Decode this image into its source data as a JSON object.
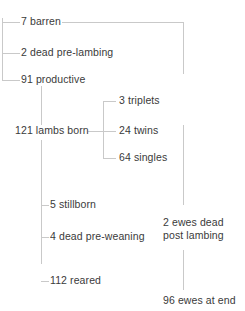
{
  "diagram": {
    "type": "flow-tree",
    "line_color": "#c9c9c9",
    "text_color": "#3a3a3a",
    "background": "#ffffff"
  },
  "nodes": {
    "barren": {
      "label": "7 barren",
      "value": 7,
      "name": "barren"
    },
    "dead_pre_lambing": {
      "label": "2 dead pre-lambing",
      "value": 2,
      "name": "dead pre-lambing"
    },
    "productive": {
      "label": "91 productive",
      "value": 91,
      "name": "productive"
    },
    "lambs_born": {
      "label": "121 lambs born",
      "value": 121,
      "name": "lambs born"
    },
    "triplets": {
      "label": "3 triplets",
      "value": 3,
      "name": "triplets"
    },
    "twins": {
      "label": "24 twins",
      "value": 24,
      "name": "twins"
    },
    "singles": {
      "label": "64 singles",
      "value": 64,
      "name": "singles"
    },
    "stillborn": {
      "label": "5 stillborn",
      "value": 5,
      "name": "stillborn"
    },
    "dead_pre_weaning": {
      "label": "4 dead pre-weaning",
      "value": 4,
      "name": "dead pre-weaning"
    },
    "reared": {
      "label": "112 reared",
      "value": 112,
      "name": "reared"
    },
    "ewes_dead_post_lambing": {
      "label": "2 ewes dead post lambing",
      "value": 2,
      "name": "ewes dead post lambing"
    },
    "ewes_at_end": {
      "label": "96 ewes at end",
      "value": 96,
      "name": "ewes at end"
    }
  }
}
